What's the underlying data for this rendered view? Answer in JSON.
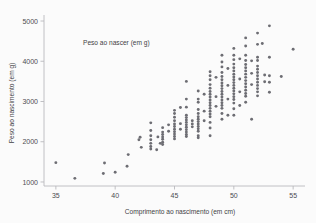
{
  "chart_data": {
    "type": "scatter",
    "title": "",
    "annotation": "Peso ao nascer (em g)",
    "xlabel": "Comprimento ao nascimento (em cm)",
    "ylabel": "Peso ao nascimento (em g)",
    "xlim": [
      34.0,
      56.0
    ],
    "ylim": [
      900,
      5100
    ],
    "xticks": [
      35,
      40,
      45,
      50,
      55
    ],
    "yticks": [
      1000,
      2000,
      3000,
      4000,
      5000
    ],
    "xtick_labels": [
      "35",
      "40",
      "45",
      "50",
      "55"
    ],
    "ytick_labels": [
      "1000",
      "2000",
      "3000",
      "4000",
      "5000"
    ],
    "grid": false,
    "legend": "none",
    "marker_color": "#6d6d73",
    "axis_color": "#b9b9bd",
    "background_color": "#fbfbfb",
    "series": [
      {
        "name": "recem-nascidos",
        "points": [
          [
            35.0,
            1480
          ],
          [
            36.6,
            1090
          ],
          [
            39.0,
            1210
          ],
          [
            39.1,
            1470
          ],
          [
            40.0,
            1240
          ],
          [
            41.0,
            1390
          ],
          [
            41.1,
            1680
          ],
          [
            42.0,
            2050
          ],
          [
            42.1,
            2110
          ],
          [
            42.2,
            1860
          ],
          [
            43.0,
            2470
          ],
          [
            43.0,
            2280
          ],
          [
            43.0,
            2150
          ],
          [
            43.0,
            2050
          ],
          [
            43.0,
            1960
          ],
          [
            43.0,
            1880
          ],
          [
            43.0,
            1820
          ],
          [
            43.5,
            1800
          ],
          [
            43.6,
            2120
          ],
          [
            43.8,
            1960
          ],
          [
            44.0,
            2350
          ],
          [
            44.0,
            2240
          ],
          [
            44.0,
            2180
          ],
          [
            44.0,
            2120
          ],
          [
            44.0,
            2060
          ],
          [
            44.0,
            1990
          ],
          [
            44.0,
            1930
          ],
          [
            44.5,
            2420
          ],
          [
            44.5,
            2260
          ],
          [
            45.0,
            2780
          ],
          [
            45.0,
            2700
          ],
          [
            45.0,
            2610
          ],
          [
            45.0,
            2520
          ],
          [
            45.0,
            2440
          ],
          [
            45.0,
            2380
          ],
          [
            45.0,
            2310
          ],
          [
            45.0,
            2250
          ],
          [
            45.0,
            2190
          ],
          [
            45.0,
            2130
          ],
          [
            45.0,
            2070
          ],
          [
            45.5,
            2850
          ],
          [
            45.5,
            2450
          ],
          [
            45.5,
            2310
          ],
          [
            46.0,
            3500
          ],
          [
            46.0,
            3060
          ],
          [
            46.0,
            2860
          ],
          [
            46.0,
            2660
          ],
          [
            46.0,
            2600
          ],
          [
            46.0,
            2540
          ],
          [
            46.0,
            2480
          ],
          [
            46.0,
            2420
          ],
          [
            46.0,
            2360
          ],
          [
            46.0,
            2300
          ],
          [
            46.0,
            2240
          ],
          [
            46.0,
            2180
          ],
          [
            46.0,
            2130
          ],
          [
            46.5,
            2520
          ],
          [
            46.5,
            2440
          ],
          [
            46.5,
            2370
          ],
          [
            47.0,
            3260
          ],
          [
            47.0,
            3060
          ],
          [
            47.0,
            2980
          ],
          [
            47.0,
            2800
          ],
          [
            47.0,
            2700
          ],
          [
            47.0,
            2620
          ],
          [
            47.0,
            2560
          ],
          [
            47.0,
            2500
          ],
          [
            47.0,
            2440
          ],
          [
            47.0,
            2380
          ],
          [
            47.0,
            2320
          ],
          [
            47.0,
            2260
          ],
          [
            47.0,
            2150
          ],
          [
            47.0,
            2100
          ],
          [
            47.5,
            3180
          ],
          [
            47.5,
            2760
          ],
          [
            47.5,
            2520
          ],
          [
            48.0,
            3740
          ],
          [
            48.0,
            3640
          ],
          [
            48.0,
            3540
          ],
          [
            48.0,
            3420
          ],
          [
            48.0,
            3330
          ],
          [
            48.0,
            3250
          ],
          [
            48.0,
            3180
          ],
          [
            48.0,
            3110
          ],
          [
            48.0,
            3040
          ],
          [
            48.0,
            2970
          ],
          [
            48.0,
            2900
          ],
          [
            48.0,
            2830
          ],
          [
            48.0,
            2760
          ],
          [
            48.0,
            2690
          ],
          [
            48.0,
            2620
          ],
          [
            48.0,
            2480
          ],
          [
            48.0,
            2340
          ],
          [
            48.0,
            2150
          ],
          [
            48.5,
            3600
          ],
          [
            48.5,
            3120
          ],
          [
            48.5,
            2880
          ],
          [
            49.0,
            4150
          ],
          [
            49.0,
            3980
          ],
          [
            49.0,
            3860
          ],
          [
            49.0,
            3720
          ],
          [
            49.0,
            3620
          ],
          [
            49.0,
            3540
          ],
          [
            49.0,
            3460
          ],
          [
            49.0,
            3390
          ],
          [
            49.0,
            3320
          ],
          [
            49.0,
            3250
          ],
          [
            49.0,
            3180
          ],
          [
            49.0,
            3110
          ],
          [
            49.0,
            3040
          ],
          [
            49.0,
            2970
          ],
          [
            49.0,
            2900
          ],
          [
            49.0,
            2830
          ],
          [
            49.0,
            2700
          ],
          [
            49.0,
            2560
          ],
          [
            49.5,
            3820
          ],
          [
            49.5,
            3400
          ],
          [
            49.5,
            3060
          ],
          [
            49.5,
            2660
          ],
          [
            50.0,
            4320
          ],
          [
            50.0,
            4150
          ],
          [
            50.0,
            4040
          ],
          [
            50.0,
            3930
          ],
          [
            50.0,
            3840
          ],
          [
            50.0,
            3760
          ],
          [
            50.0,
            3680
          ],
          [
            50.0,
            3610
          ],
          [
            50.0,
            3540
          ],
          [
            50.0,
            3470
          ],
          [
            50.0,
            3400
          ],
          [
            50.0,
            3330
          ],
          [
            50.0,
            3260
          ],
          [
            50.0,
            3190
          ],
          [
            50.0,
            3120
          ],
          [
            50.0,
            3050
          ],
          [
            50.0,
            2960
          ],
          [
            50.0,
            2820
          ],
          [
            50.0,
            2660
          ],
          [
            50.5,
            4060
          ],
          [
            50.5,
            3560
          ],
          [
            50.5,
            3240
          ],
          [
            50.5,
            2900
          ],
          [
            51.0,
            4580
          ],
          [
            51.0,
            4380
          ],
          [
            51.0,
            4150
          ],
          [
            51.0,
            4020
          ],
          [
            51.0,
            3920
          ],
          [
            51.0,
            3840
          ],
          [
            51.0,
            3760
          ],
          [
            51.0,
            3680
          ],
          [
            51.0,
            3600
          ],
          [
            51.0,
            3520
          ],
          [
            51.0,
            3440
          ],
          [
            51.0,
            3360
          ],
          [
            51.0,
            3280
          ],
          [
            51.0,
            3200
          ],
          [
            51.0,
            3130
          ],
          [
            51.0,
            2980
          ],
          [
            51.5,
            4010
          ],
          [
            51.5,
            3700
          ],
          [
            51.5,
            3420
          ],
          [
            51.5,
            2560
          ],
          [
            52.0,
            4700
          ],
          [
            52.0,
            4420
          ],
          [
            52.0,
            4100
          ],
          [
            52.0,
            4020
          ],
          [
            52.0,
            3880
          ],
          [
            52.0,
            3800
          ],
          [
            52.0,
            3720
          ],
          [
            52.0,
            3640
          ],
          [
            52.0,
            3560
          ],
          [
            52.0,
            3480
          ],
          [
            52.0,
            3400
          ],
          [
            52.0,
            3320
          ],
          [
            52.0,
            3240
          ],
          [
            52.0,
            3140
          ],
          [
            52.4,
            4440
          ],
          [
            52.6,
            3660
          ],
          [
            52.6,
            3490
          ],
          [
            53.0,
            4880
          ],
          [
            53.0,
            4100
          ],
          [
            53.0,
            3640
          ],
          [
            53.0,
            3480
          ],
          [
            53.0,
            3230
          ],
          [
            54.0,
            3620
          ],
          [
            55.0,
            4300
          ]
        ]
      }
    ]
  }
}
